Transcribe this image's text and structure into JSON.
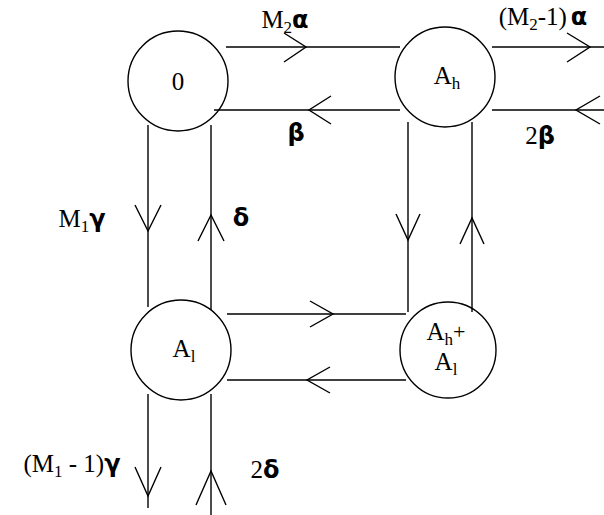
{
  "diagram": {
    "type": "state-transition-diagram",
    "background_color": "#ffffff",
    "stroke_color": "#000000",
    "nodes": [
      {
        "id": "zero",
        "label": "0",
        "label_lines": [
          "0"
        ],
        "cx": 178,
        "cy": 81,
        "r": 50,
        "position": "top-left"
      },
      {
        "id": "ah",
        "label": "A_h",
        "label_main": "A",
        "label_sub": "h",
        "cx": 445,
        "cy": 77,
        "r": 50,
        "position": "top-right"
      },
      {
        "id": "al",
        "label": "A_l",
        "label_main": "A",
        "label_sub": "l",
        "cx": 181,
        "cy": 350,
        "r": 50,
        "position": "bottom-left"
      },
      {
        "id": "ahal",
        "label": "A_h+ A_l",
        "line1_main": "A",
        "line1_sub": "h",
        "line1_sup": "+",
        "line2_main": "A",
        "line2_sub": "l",
        "cx": 448,
        "cy": 350,
        "r": 48,
        "position": "bottom-right"
      }
    ],
    "edge_labels": [
      {
        "id": "m2-alpha",
        "text": "M2α",
        "main": "M",
        "sub": "2",
        "greek": "α",
        "x": 285,
        "y": 22,
        "describes": "zero-to-ah-forward"
      },
      {
        "id": "beta",
        "text": "β",
        "main": "",
        "sub": "",
        "greek": "β",
        "x": 296,
        "y": 133,
        "describes": "ah-to-zero-backward"
      },
      {
        "id": "m2-minus-1-alpha",
        "text": "(M2-1) α",
        "prefix": "(M",
        "sub": "2",
        "suffix": "-1)",
        "greek": "α",
        "x": 543,
        "y": 19,
        "describes": "ah-outgoing-right"
      },
      {
        "id": "two-beta",
        "text": "2β",
        "main": "2",
        "sub": "",
        "greek": "β",
        "x": 540,
        "y": 136,
        "describes": "incoming-right-to-ah"
      },
      {
        "id": "m1-gamma",
        "text": "M1γ",
        "main": "M",
        "sub": "1",
        "greek": "γ",
        "x": 82,
        "y": 221,
        "describes": "zero-to-al-down"
      },
      {
        "id": "delta",
        "text": "δ",
        "main": "",
        "sub": "",
        "greek": "δ",
        "x": 241,
        "y": 218,
        "describes": "al-to-zero-up"
      },
      {
        "id": "m1-minus-1-gamma",
        "text": "(M1 - 1)γ",
        "prefix": "(M",
        "sub": "1",
        "suffix": " - 1)",
        "greek": "γ",
        "x": 72,
        "y": 466,
        "describes": "al-outgoing-down"
      },
      {
        "id": "two-delta",
        "text": "2δ",
        "main": "2",
        "sub": "",
        "greek": "δ",
        "x": 265,
        "y": 470,
        "describes": "incoming-bottom-to-al"
      }
    ],
    "edges": [
      {
        "id": "zero-to-ah",
        "from": "zero",
        "to": "ah",
        "direction": "right",
        "label": "m2-alpha"
      },
      {
        "id": "ah-to-zero",
        "from": "ah",
        "to": "zero",
        "direction": "left",
        "label": "beta"
      },
      {
        "id": "ah-out-right",
        "from": "ah",
        "to": "external",
        "direction": "right",
        "label": "m2-minus-1-alpha"
      },
      {
        "id": "external-to-ah",
        "from": "external",
        "to": "ah",
        "direction": "left",
        "label": "two-beta"
      },
      {
        "id": "zero-to-al",
        "from": "zero",
        "to": "al",
        "direction": "down",
        "label": "m1-gamma"
      },
      {
        "id": "al-to-zero",
        "from": "al",
        "to": "zero",
        "direction": "up",
        "label": "delta"
      },
      {
        "id": "al-out-down",
        "from": "al",
        "to": "external",
        "direction": "down",
        "label": "m1-minus-1-gamma"
      },
      {
        "id": "external-to-al",
        "from": "external",
        "to": "al",
        "direction": "up",
        "label": "two-delta"
      },
      {
        "id": "al-to-ahal",
        "from": "al",
        "to": "ahal",
        "direction": "right",
        "label": null
      },
      {
        "id": "ahal-to-al",
        "from": "ahal",
        "to": "al",
        "direction": "left",
        "label": null
      },
      {
        "id": "ah-to-ahal",
        "from": "ah",
        "to": "ahal",
        "direction": "down",
        "label": null
      },
      {
        "id": "ahal-to-ah",
        "from": "ahal",
        "to": "ah",
        "direction": "up",
        "label": null
      }
    ]
  }
}
